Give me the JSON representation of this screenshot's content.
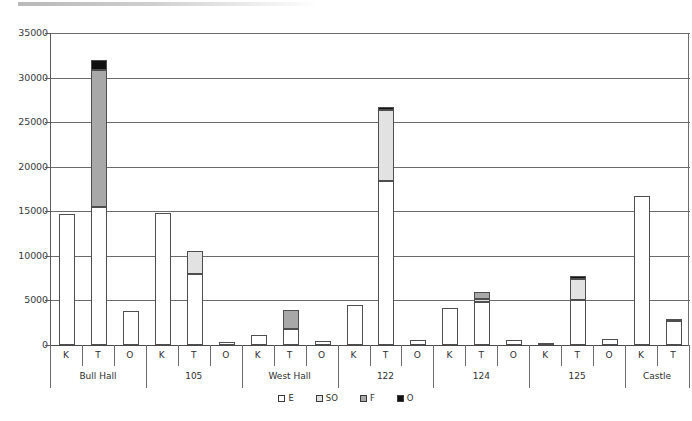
{
  "chart_data": {
    "type": "bar",
    "subtype": "stacked-bar",
    "title": "",
    "subtitle": "",
    "xlabel": "",
    "ylabel": "",
    "ylim": [
      0,
      35000
    ],
    "ytick_step": 5000,
    "ytick_labels": [
      "35000",
      "30000",
      "25000",
      "20000",
      "15000",
      "10000",
      "5000",
      "0"
    ],
    "ytick_values": [
      35000,
      30000,
      25000,
      20000,
      15000,
      10000,
      5000,
      0
    ],
    "grid": true,
    "legend_position": "bottom",
    "groups": [
      "Bull Hall",
      "105",
      "West Hall",
      "122",
      "124",
      "125",
      "Castle"
    ],
    "subcategories": [
      "K",
      "T",
      "O"
    ],
    "legend": [
      {
        "key": "E",
        "label": "E",
        "color": "#ffffff"
      },
      {
        "key": "SO",
        "label": "SO",
        "color": "#e2e2e2"
      },
      {
        "key": "F",
        "label": "F",
        "color": "#a8a8a8"
      },
      {
        "key": "O",
        "label": "O",
        "color": "#111111"
      }
    ],
    "series": [
      {
        "name": "E",
        "color": "#ffffff",
        "values": [
          14650,
          15500,
          3800,
          14800,
          8000,
          330,
          1100,
          1800,
          500,
          4450,
          18400,
          600,
          4100,
          4800,
          550,
          250,
          5000,
          700,
          16700,
          2750
        ]
      },
      {
        "name": "SO",
        "color": "#e2e2e2",
        "values": [
          0,
          0,
          0,
          0,
          2500,
          0,
          0,
          0,
          0,
          0,
          8000,
          0,
          0,
          400,
          0,
          0,
          2400,
          0,
          0,
          0
        ]
      },
      {
        "name": "F",
        "color": "#a8a8a8",
        "values": [
          0,
          15300,
          0,
          0,
          0,
          0,
          0,
          2100,
          0,
          0,
          0,
          0,
          0,
          800,
          0,
          0,
          0,
          0,
          0,
          0
        ]
      },
      {
        "name": "O",
        "color": "#111111",
        "values": [
          0,
          1200,
          0,
          0,
          0,
          0,
          0,
          0,
          0,
          0,
          300,
          0,
          0,
          0,
          0,
          0,
          300,
          0,
          0,
          180
        ]
      }
    ],
    "bars": [
      {
        "group": "Bull Hall",
        "sub": "K",
        "total": 14650,
        "segments": [
          {
            "series": "E",
            "value": 14650
          }
        ]
      },
      {
        "group": "Bull Hall",
        "sub": "T",
        "total": 32000,
        "segments": [
          {
            "series": "E",
            "value": 15500
          },
          {
            "series": "F",
            "value": 15300
          },
          {
            "series": "O",
            "value": 1200
          }
        ]
      },
      {
        "group": "Bull Hall",
        "sub": "O",
        "total": 3800,
        "segments": [
          {
            "series": "E",
            "value": 3800
          }
        ]
      },
      {
        "group": "105",
        "sub": "K",
        "total": 14800,
        "segments": [
          {
            "series": "E",
            "value": 14800
          }
        ]
      },
      {
        "group": "105",
        "sub": "T",
        "total": 10500,
        "segments": [
          {
            "series": "E",
            "value": 8000
          },
          {
            "series": "SO",
            "value": 2500
          }
        ]
      },
      {
        "group": "105",
        "sub": "O",
        "total": 330,
        "segments": [
          {
            "series": "E",
            "value": 330
          }
        ]
      },
      {
        "group": "West Hall",
        "sub": "K",
        "total": 1100,
        "segments": [
          {
            "series": "E",
            "value": 1100
          }
        ]
      },
      {
        "group": "West Hall",
        "sub": "T",
        "total": 3900,
        "segments": [
          {
            "series": "E",
            "value": 1800
          },
          {
            "series": "F",
            "value": 2100
          }
        ]
      },
      {
        "group": "West Hall",
        "sub": "O",
        "total": 500,
        "segments": [
          {
            "series": "E",
            "value": 500
          }
        ]
      },
      {
        "group": "122",
        "sub": "K",
        "total": 4450,
        "segments": [
          {
            "series": "E",
            "value": 4450
          }
        ]
      },
      {
        "group": "122",
        "sub": "T",
        "total": 26700,
        "segments": [
          {
            "series": "E",
            "value": 18400
          },
          {
            "series": "SO",
            "value": 8000
          },
          {
            "series": "O",
            "value": 300
          }
        ]
      },
      {
        "group": "122",
        "sub": "O",
        "total": 600,
        "segments": [
          {
            "series": "E",
            "value": 600
          }
        ]
      },
      {
        "group": "124",
        "sub": "K",
        "total": 4100,
        "segments": [
          {
            "series": "E",
            "value": 4100
          }
        ]
      },
      {
        "group": "124",
        "sub": "T",
        "total": 6000,
        "segments": [
          {
            "series": "E",
            "value": 4800
          },
          {
            "series": "SO",
            "value": 400
          },
          {
            "series": "F",
            "value": 800
          }
        ]
      },
      {
        "group": "124",
        "sub": "O",
        "total": 550,
        "segments": [
          {
            "series": "E",
            "value": 550
          }
        ]
      },
      {
        "group": "125",
        "sub": "K",
        "total": 250,
        "segments": [
          {
            "series": "E",
            "value": 250
          }
        ]
      },
      {
        "group": "125",
        "sub": "T",
        "total": 7700,
        "segments": [
          {
            "series": "E",
            "value": 5000
          },
          {
            "series": "SO",
            "value": 2400
          },
          {
            "series": "O",
            "value": 300
          }
        ]
      },
      {
        "group": "125",
        "sub": "O",
        "total": 700,
        "segments": [
          {
            "series": "E",
            "value": 700
          }
        ]
      },
      {
        "group": "Castle",
        "sub": "K",
        "total": 16700,
        "segments": [
          {
            "series": "E",
            "value": 16700
          }
        ]
      },
      {
        "group": "Castle",
        "sub": "T",
        "total": 2930,
        "segments": [
          {
            "series": "E",
            "value": 2750
          },
          {
            "series": "O",
            "value": 180
          }
        ]
      }
    ]
  }
}
